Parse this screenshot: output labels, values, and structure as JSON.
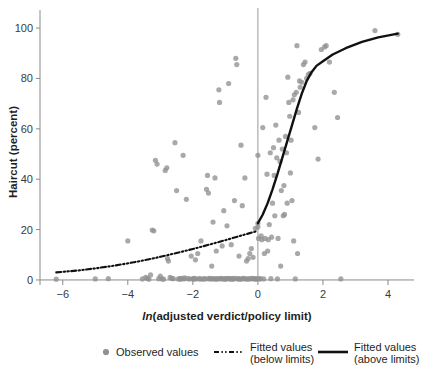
{
  "chart_data": {
    "type": "scatter",
    "title": "",
    "xlabel": "ln(adjusted verdict/policy limit)",
    "xlabel_italic_prefix": "ln",
    "xlabel_rest": "(adjusted verdict/policy limit)",
    "ylabel": "Haircut (percent)",
    "xlim": [
      -6.7,
      4.8
    ],
    "ylim": [
      -2,
      104
    ],
    "xticks": [
      -6,
      -4,
      -2,
      0,
      2,
      4
    ],
    "xticklabels": [
      "−6",
      "−4",
      "−2",
      "0",
      "2",
      "4"
    ],
    "yticks": [
      0,
      20,
      40,
      60,
      80,
      100
    ],
    "yticklabels": [
      "0",
      "20",
      "40",
      "60",
      "80",
      "100"
    ],
    "grid": false,
    "legend_position": "bottom",
    "reference_line_x": 0,
    "colors": {
      "observed_points": "#919191",
      "fitted_line": "#111111",
      "axis": "#8a8a8a",
      "text": "#1f1f1f",
      "background": "#ffffff"
    },
    "legend": [
      {
        "label": "Observed values",
        "marker": "circle",
        "color": "#919191"
      },
      {
        "label": "Fitted values\n(below limits)",
        "label_line1": "Fitted values",
        "label_line2": "(below limits)",
        "marker": "dashdot-line",
        "color": "#111111"
      },
      {
        "label": "Fitted values\n(above limits)",
        "label_line1": "Fitted values",
        "label_line2": "(above limits)",
        "marker": "solid-line",
        "color": "#111111"
      }
    ],
    "series": [
      {
        "name": "Observed values",
        "type": "scatter",
        "points": [
          [
            -6.2,
            0.3
          ],
          [
            -5.0,
            0.4
          ],
          [
            -4.6,
            0.5
          ],
          [
            -4.0,
            15.5
          ],
          [
            -3.55,
            0.4
          ],
          [
            -3.45,
            1.0
          ],
          [
            -3.4,
            0.6
          ],
          [
            -3.35,
            0.3
          ],
          [
            -3.3,
            2.0
          ],
          [
            -3.25,
            19.8
          ],
          [
            -3.2,
            19.5
          ],
          [
            -3.15,
            47.5
          ],
          [
            -3.1,
            46.0
          ],
          [
            -3.05,
            0.5
          ],
          [
            -3.0,
            1.5
          ],
          [
            -2.95,
            0.4
          ],
          [
            -2.9,
            0.3
          ],
          [
            -2.85,
            43.5
          ],
          [
            -2.8,
            44.5
          ],
          [
            -2.78,
            8.5
          ],
          [
            -2.75,
            7.5
          ],
          [
            -2.7,
            1.0
          ],
          [
            -2.65,
            0.6
          ],
          [
            -2.6,
            0.5
          ],
          [
            -2.55,
            54.5
          ],
          [
            -2.5,
            35.5
          ],
          [
            -2.45,
            0.4
          ],
          [
            -2.4,
            0.5
          ],
          [
            -2.38,
            0.3
          ],
          [
            -2.35,
            0.6
          ],
          [
            -2.3,
            49.5
          ],
          [
            -2.28,
            0.4
          ],
          [
            -2.25,
            0.8
          ],
          [
            -2.2,
            32.0
          ],
          [
            -2.15,
            0.5
          ],
          [
            -2.1,
            0.4
          ],
          [
            -2.05,
            9.5
          ],
          [
            -2.0,
            0.5
          ],
          [
            -1.98,
            0.3
          ],
          [
            -1.95,
            0.6
          ],
          [
            -1.92,
            8.0
          ],
          [
            -1.9,
            0.4
          ],
          [
            -1.85,
            10.5
          ],
          [
            -1.8,
            0.5
          ],
          [
            -1.78,
            0.4
          ],
          [
            -1.75,
            15.5
          ],
          [
            -1.7,
            0.3
          ],
          [
            -1.65,
            0.5
          ],
          [
            -1.6,
            0.4
          ],
          [
            -1.58,
            36.0
          ],
          [
            -1.55,
            41.5
          ],
          [
            -1.52,
            34.5
          ],
          [
            -1.5,
            0.6
          ],
          [
            -1.48,
            0.4
          ],
          [
            -1.45,
            0.5
          ],
          [
            -1.42,
            5.5
          ],
          [
            -1.4,
            0.4
          ],
          [
            -1.38,
            23.0
          ],
          [
            -1.35,
            0.5
          ],
          [
            -1.32,
            40.5
          ],
          [
            -1.3,
            0.3
          ],
          [
            -1.28,
            11.5
          ],
          [
            -1.25,
            0.5
          ],
          [
            -1.22,
            0.4
          ],
          [
            -1.2,
            75.5
          ],
          [
            -1.18,
            70.5
          ],
          [
            -1.15,
            0.6
          ],
          [
            -1.12,
            0.4
          ],
          [
            -1.1,
            13.5
          ],
          [
            -1.08,
            0.5
          ],
          [
            -1.05,
            27.5
          ],
          [
            -1.02,
            0.3
          ],
          [
            -1.0,
            0.5
          ],
          [
            -0.98,
            0.4
          ],
          [
            -0.95,
            21.5
          ],
          [
            -0.92,
            0.6
          ],
          [
            -0.9,
            78.0
          ],
          [
            -0.88,
            0.4
          ],
          [
            -0.85,
            0.5
          ],
          [
            -0.82,
            14.0
          ],
          [
            -0.8,
            0.3
          ],
          [
            -0.78,
            0.5
          ],
          [
            -0.75,
            0.4
          ],
          [
            -0.72,
            31.5
          ],
          [
            -0.7,
            0.6
          ],
          [
            -0.68,
            88.0
          ],
          [
            -0.65,
            85.5
          ],
          [
            -0.62,
            0.4
          ],
          [
            -0.6,
            0.5
          ],
          [
            -0.58,
            9.5
          ],
          [
            -0.55,
            0.3
          ],
          [
            -0.52,
            53.5
          ],
          [
            -0.5,
            0.4
          ],
          [
            -0.48,
            29.5
          ],
          [
            -0.45,
            0.6
          ],
          [
            -0.42,
            0.5
          ],
          [
            -0.4,
            40.5
          ],
          [
            -0.38,
            0.4
          ],
          [
            -0.35,
            7.5
          ],
          [
            -0.32,
            0.3
          ],
          [
            -0.3,
            8.5
          ],
          [
            -0.28,
            0.5
          ],
          [
            -0.25,
            10.5
          ],
          [
            -0.22,
            0.4
          ],
          [
            -0.2,
            12.5
          ],
          [
            -0.18,
            0.6
          ],
          [
            -0.15,
            9.0
          ],
          [
            -0.12,
            0.5
          ],
          [
            -0.1,
            0.4
          ],
          [
            -0.08,
            20.5
          ],
          [
            -0.05,
            0.3
          ],
          [
            -0.02,
            0.5
          ],
          [
            0.0,
            22.5
          ],
          [
            0.0,
            21.0
          ],
          [
            0.0,
            49.5
          ],
          [
            0.02,
            16.5
          ],
          [
            0.05,
            0.4
          ],
          [
            0.08,
            0.5
          ],
          [
            0.1,
            17.5
          ],
          [
            0.12,
            16.0
          ],
          [
            0.15,
            60.5
          ],
          [
            0.18,
            0.4
          ],
          [
            0.2,
            10.5
          ],
          [
            0.22,
            16.5
          ],
          [
            0.25,
            72.5
          ],
          [
            0.28,
            42.0
          ],
          [
            0.3,
            11.5
          ],
          [
            0.32,
            16.0
          ],
          [
            0.35,
            22.0
          ],
          [
            0.38,
            50.5
          ],
          [
            0.4,
            0.5
          ],
          [
            0.42,
            17.0
          ],
          [
            0.45,
            30.5
          ],
          [
            0.48,
            52.5
          ],
          [
            0.5,
            41.5
          ],
          [
            0.52,
            25.5
          ],
          [
            0.55,
            61.5
          ],
          [
            0.58,
            48.5
          ],
          [
            0.6,
            0.4
          ],
          [
            0.62,
            16.5
          ],
          [
            0.65,
            55.5
          ],
          [
            0.68,
            47.0
          ],
          [
            0.7,
            5.5
          ],
          [
            0.72,
            35.5
          ],
          [
            0.75,
            52.0
          ],
          [
            0.78,
            25.5
          ],
          [
            0.8,
            37.5
          ],
          [
            0.82,
            26.0
          ],
          [
            0.85,
            57.0
          ],
          [
            0.88,
            50.5
          ],
          [
            0.9,
            30.5
          ],
          [
            0.92,
            80.5
          ],
          [
            0.95,
            70.5
          ],
          [
            0.98,
            65.0
          ],
          [
            1.0,
            42.5
          ],
          [
            1.02,
            55.5
          ],
          [
            1.05,
            31.5
          ],
          [
            1.08,
            71.5
          ],
          [
            1.1,
            15.5
          ],
          [
            1.12,
            73.5
          ],
          [
            1.15,
            0.4
          ],
          [
            1.18,
            74.5
          ],
          [
            1.2,
            93.0
          ],
          [
            1.22,
            10.5
          ],
          [
            1.25,
            66.5
          ],
          [
            1.28,
            79.0
          ],
          [
            1.3,
            76.5
          ],
          [
            1.35,
            78.5
          ],
          [
            1.4,
            85.5
          ],
          [
            1.45,
            86.5
          ],
          [
            1.5,
            80.0
          ],
          [
            1.55,
            81.5
          ],
          [
            1.6,
            82.0
          ],
          [
            1.75,
            60.5
          ],
          [
            1.85,
            48.0
          ],
          [
            1.95,
            91.5
          ],
          [
            2.05,
            92.5
          ],
          [
            2.1,
            93.0
          ],
          [
            2.2,
            86.5
          ],
          [
            2.35,
            74.5
          ],
          [
            2.45,
            64.5
          ],
          [
            2.55,
            0.4
          ],
          [
            3.6,
            99.0
          ],
          [
            4.3,
            97.5
          ]
        ]
      },
      {
        "name": "Fitted values (below limits)",
        "type": "line",
        "style": "dashdot",
        "points": [
          [
            -6.2,
            3.0
          ],
          [
            -5.5,
            3.8
          ],
          [
            -5.0,
            4.6
          ],
          [
            -4.5,
            5.5
          ],
          [
            -4.0,
            6.6
          ],
          [
            -3.5,
            7.8
          ],
          [
            -3.0,
            9.2
          ],
          [
            -2.5,
            10.7
          ],
          [
            -2.0,
            12.3
          ],
          [
            -1.5,
            14.0
          ],
          [
            -1.0,
            15.8
          ],
          [
            -0.6,
            17.3
          ],
          [
            -0.3,
            18.4
          ],
          [
            -0.05,
            19.3
          ]
        ]
      },
      {
        "name": "Fitted values (above limits)",
        "type": "line",
        "style": "solid",
        "points": [
          [
            0.0,
            22.5
          ],
          [
            0.15,
            26.0
          ],
          [
            0.3,
            30.5
          ],
          [
            0.45,
            36.0
          ],
          [
            0.6,
            42.0
          ],
          [
            0.75,
            48.5
          ],
          [
            0.9,
            55.0
          ],
          [
            1.05,
            61.5
          ],
          [
            1.2,
            68.0
          ],
          [
            1.35,
            74.0
          ],
          [
            1.5,
            79.0
          ],
          [
            1.65,
            82.5
          ],
          [
            1.8,
            85.0
          ],
          [
            2.0,
            86.8
          ],
          [
            2.3,
            89.5
          ],
          [
            2.7,
            92.0
          ],
          [
            3.2,
            94.5
          ],
          [
            3.7,
            96.3
          ],
          [
            4.3,
            97.8
          ]
        ]
      }
    ]
  },
  "geometry": {
    "plot_left": 40,
    "plot_right": 414,
    "plot_top": 18,
    "plot_bottom": 285,
    "x_zero_px": 264,
    "y_zero_px": 284
  }
}
